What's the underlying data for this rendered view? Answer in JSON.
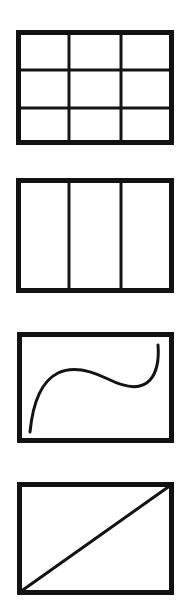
{
  "document": {
    "title": "Rectangle subdivision and curve figures",
    "background_color": "#ffffff",
    "ink_color": "#131313",
    "canvas": {
      "width": 191,
      "height": 609
    }
  },
  "figures": [
    {
      "id": "figure-grid-3x3",
      "label": "Rectangle divided into a 3 by 3 grid",
      "shape": "rectangle-grid",
      "rows": 3,
      "columns": 3,
      "cells": 9,
      "frame": {
        "x": 16,
        "y": 30,
        "width": 158,
        "height": 115
      },
      "border_width": 5,
      "inner_line_width": 3,
      "vertical_divider_fractions": [
        0.3354,
        0.6646
      ],
      "horizontal_divider_fractions": [
        0.3478,
        0.6783
      ],
      "contents": []
    },
    {
      "id": "figure-columns-3",
      "label": "Rectangle divided into 3 vertical columns",
      "shape": "rectangle-columns",
      "rows": 1,
      "columns": 3,
      "cells": 3,
      "frame": {
        "x": 16,
        "y": 178,
        "width": 158,
        "height": 115
      },
      "border_width": 5,
      "inner_line_width": 3,
      "vertical_divider_fractions": [
        0.3354,
        0.6646
      ],
      "horizontal_divider_fractions": [],
      "contents": []
    },
    {
      "id": "figure-s-curve",
      "label": "Rectangle containing an S-shaped curve",
      "shape": "rectangle-with-curve",
      "rows": 1,
      "columns": 1,
      "cells": 1,
      "frame": {
        "x": 17,
        "y": 332,
        "width": 157,
        "height": 111
      },
      "border_width": 5,
      "inner_line_width": 3,
      "vertical_divider_fractions": [],
      "horizontal_divider_fractions": [],
      "contents": [
        {
          "type": "curve",
          "name": "s-curve",
          "description": "sigmoid curve rising from lower left, flattening across the middle, then rising steeply to upper right",
          "stroke_width": 3,
          "start_point": {
            "x": 30,
            "y": 432
          },
          "end_point": {
            "x": 158,
            "y": 345
          },
          "path": "M 30 432 C 33 401, 42 381, 58 373 C 74 365, 92 371, 108 379 C 124 387, 140 391, 150 380 C 158 371, 159 358, 158 345"
        }
      ]
    },
    {
      "id": "figure-diagonal",
      "label": "Rectangle with a diagonal line from bottom left to top right",
      "shape": "rectangle-with-diagonal",
      "rows": 1,
      "columns": 1,
      "cells": 1,
      "frame": {
        "x": 17,
        "y": 482,
        "width": 157,
        "height": 113
      },
      "border_width": 5,
      "inner_line_width": 3,
      "vertical_divider_fractions": [],
      "horizontal_divider_fractions": [],
      "contents": [
        {
          "type": "line",
          "name": "diagonal-line",
          "description": "straight diagonal from bottom-left corner to top-right corner",
          "stroke_width": 3,
          "start_point": {
            "x": 20,
            "y": 592
          },
          "end_point": {
            "x": 171,
            "y": 485
          }
        }
      ]
    }
  ]
}
